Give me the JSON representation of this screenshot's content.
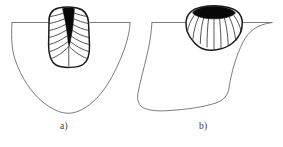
{
  "figure": {
    "background_color": "#ffffff",
    "line_color": "#4a4a4a",
    "weld_outline_color": "#1a1a1a",
    "fusion_zone_fill": "#000000",
    "grain_line_color": "#2b2b2b",
    "width": 283,
    "height": 147,
    "panels": [
      {
        "id": "panel-a",
        "caption": "a)",
        "description": "Narrow deep U-shaped weld bead with dark tapered fusion core and columnar grain lines, in a rounded-bottom base plate section",
        "weld_shape": "narrow-deep-u",
        "nugget_shape": "tapered-wedge",
        "grain_lines": 14,
        "base_profile": "round-bottom"
      },
      {
        "id": "panel-b",
        "caption": "b)",
        "description": "Shallow wide lens-shaped weld bead with dark elliptical cap and radiating columnar grain lines, in a trapezoidal base plate section",
        "weld_shape": "shallow-wide-lens",
        "nugget_shape": "elliptical-cap",
        "grain_lines": 11,
        "base_profile": "trapezoid-bottom"
      }
    ]
  },
  "captions": {
    "a": "a)",
    "b": "b)"
  }
}
